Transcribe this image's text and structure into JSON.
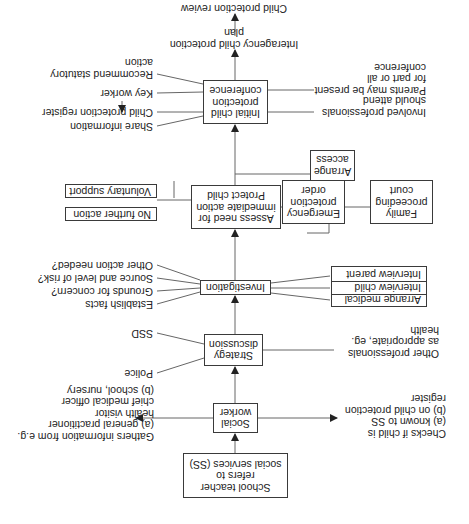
{
  "orientation": "rotated 180 degrees (upside-down)",
  "colors": {
    "line": "#555555",
    "box_border": "#3a3a3a",
    "text": "#222222",
    "background": "#ffffff"
  },
  "nodes": {
    "school_teacher": "School teacher\nrefers to\nsocial services (SS)",
    "social_worker": "Social\nworker",
    "strategy_discussion": "Strategy\ndiscussion",
    "investigation": "Investigation",
    "assess": "Assess need for\nimmediate action\nProtect child",
    "initial_conference": "Initial child\nprotection\nconference",
    "no_further_action": "No further action",
    "voluntary_support": "Voluntary support",
    "emergency_protection_order": "Emergency\nprotection\norder",
    "family_proceeding_court": "Family\nproceeding\ncourt",
    "arrange_access": "Arrange\naccess",
    "interview_parent": "Interview parent",
    "interview_child": "Interview child",
    "arrange_medical": "Arrange medical",
    "interagency_plan": "Interagency child protection plan",
    "child_protection_review": "Child protection review"
  },
  "labels": {
    "gathers_info": "Gathers information from e.g.\n(a)  general practitioner\n       health visitor\n       chief medical officer\n(b)  school, nursery",
    "checks_child": "Checks if child is\n(a)  known to SS\n(b)  on child protection\n       register",
    "police": "Police",
    "ssd": "SSD",
    "other_professionals": "Other professionals\nas appropriate, eg.\nhealth",
    "establish_facts": "Establish facts",
    "grounds_concern": "Grounds for concern?",
    "source_risk": "Source and level of risk?",
    "other_action": "Other action needed?",
    "share_information": "Share information",
    "child_protection_register": "Child protection register",
    "key_worker": "Key worker",
    "recommend_statutory": "Recommend statutory\naction",
    "involved_professionals": "Involved professionals\nshould attend",
    "parents_present": "Parents may be present\nfor part or all conference"
  }
}
